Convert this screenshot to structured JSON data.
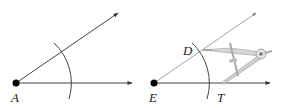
{
  "figures": [
    {
      "id": "left",
      "vertex": {
        "label": "A",
        "x": 16,
        "y": 83
      },
      "rays": [
        {
          "name": "horizontal",
          "to": [
            132,
            83
          ]
        },
        {
          "name": "upper",
          "to": [
            118,
            13
          ]
        }
      ],
      "arc": {
        "radius": 55
      }
    },
    {
      "id": "right",
      "vertex": {
        "label": "E",
        "x": 154,
        "y": 83
      },
      "rays": [
        {
          "name": "horizontal",
          "to": [
            270,
            83
          ]
        },
        {
          "name": "upper",
          "to": [
            256,
            13
          ]
        }
      ],
      "arc": {
        "radius": 55
      },
      "points": [
        {
          "label": "D",
          "x": 199,
          "y": 52
        },
        {
          "label": "T",
          "x": 221,
          "y": 83
        }
      ],
      "compass": {
        "hinge": [
          261,
          54
        ]
      }
    }
  ],
  "labels": {
    "A": "A",
    "E": "E",
    "D": "D",
    "T": "T"
  },
  "colors": {
    "line": "#444444",
    "light_line": "#9a9a9a",
    "compass": "#b5b5b5",
    "point": "#000000"
  }
}
